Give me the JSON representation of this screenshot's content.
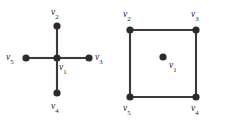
{
  "figure": {
    "background_color": "#ffffff",
    "edge_color": "#3b3b3b",
    "vertex_color": "#2b2b2b",
    "label_color": "#1c1c1c"
  },
  "chart_data": {
    "type": "diagram",
    "title": "",
    "subtitle": "",
    "panels": [
      {
        "id": "star",
        "name": "star-graph",
        "vertices": [
          {
            "id": "v1",
            "label": "v",
            "sub": "1",
            "x": 57,
            "y": 58,
            "label_x": 59,
            "label_y": 63
          },
          {
            "id": "v2",
            "label": "v",
            "sub": "2",
            "x": 57,
            "y": 26,
            "label_x": 51,
            "label_y": 8
          },
          {
            "id": "v3",
            "label": "v",
            "sub": "3",
            "x": 89,
            "y": 58,
            "label_x": 95,
            "label_y": 53
          },
          {
            "id": "v4",
            "label": "v",
            "sub": "4",
            "x": 57,
            "y": 93,
            "label_x": 51,
            "label_y": 102
          },
          {
            "id": "v5",
            "label": "v",
            "sub": "5",
            "x": 26,
            "y": 58,
            "label_x": 6,
            "label_y": 53
          }
        ],
        "edges": [
          {
            "from": "v1",
            "to": "v2"
          },
          {
            "from": "v1",
            "to": "v3"
          },
          {
            "from": "v1",
            "to": "v4"
          },
          {
            "from": "v1",
            "to": "v5"
          }
        ]
      },
      {
        "id": "square",
        "name": "cycle-graph",
        "vertices": [
          {
            "id": "v1",
            "label": "v",
            "sub": "1",
            "x": 51,
            "y": 57,
            "label_x": 57,
            "label_y": 61
          },
          {
            "id": "v2",
            "label": "v",
            "sub": "2",
            "x": 18,
            "y": 30,
            "label_x": 11,
            "label_y": 10
          },
          {
            "id": "v3",
            "label": "v",
            "sub": "3",
            "x": 84,
            "y": 30,
            "label_x": 79,
            "label_y": 10
          },
          {
            "id": "v4",
            "label": "v",
            "sub": "4",
            "x": 84,
            "y": 97,
            "label_x": 79,
            "label_y": 104
          },
          {
            "id": "v5",
            "label": "v",
            "sub": "5",
            "x": 18,
            "y": 97,
            "label_x": 11,
            "label_y": 104
          }
        ],
        "edges": [
          {
            "from": "v2",
            "to": "v3"
          },
          {
            "from": "v3",
            "to": "v4"
          },
          {
            "from": "v4",
            "to": "v5"
          },
          {
            "from": "v5",
            "to": "v2"
          }
        ]
      }
    ],
    "vertex_radius": 3.6,
    "legend": [],
    "grid": false
  }
}
